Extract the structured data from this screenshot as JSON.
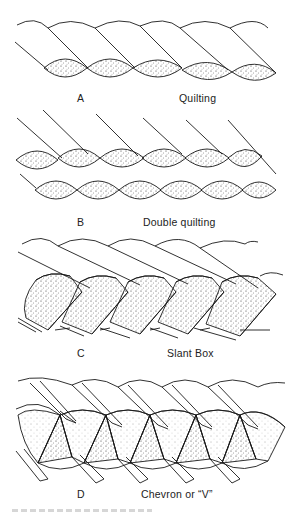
{
  "figure": {
    "panels": [
      {
        "letter": "A",
        "name": "Quilting"
      },
      {
        "letter": "B",
        "name": "Double quilting"
      },
      {
        "letter": "C",
        "name": "Slant Box"
      },
      {
        "letter": "D",
        "name": "Chevron or “V”"
      }
    ],
    "colors": {
      "ink": "#1a1a1a",
      "background": "#ffffff",
      "stipple": "#333333"
    }
  }
}
